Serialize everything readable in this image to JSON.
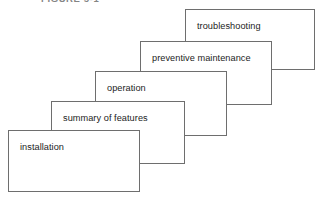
{
  "figure": {
    "caption": "FIGURE 5-1",
    "background_color": "#ffffff",
    "border_color": "#6e6e6e",
    "text_color": "#1c1c1c",
    "width": 322,
    "height": 201
  },
  "diagram": {
    "type": "cascade",
    "cards": [
      {
        "label": "troubleshooting",
        "order": 5,
        "x": 185,
        "y": 9,
        "width": 130,
        "height": 61,
        "z": 1
      },
      {
        "label": "preventive maintenance",
        "order": 4,
        "x": 140,
        "y": 41,
        "width": 132,
        "height": 64,
        "z": 2
      },
      {
        "label": "operation",
        "order": 3,
        "x": 95,
        "y": 71,
        "width": 132,
        "height": 65,
        "z": 3
      },
      {
        "label": "summary of features",
        "order": 2,
        "x": 51,
        "y": 101,
        "width": 134,
        "height": 63,
        "z": 4
      },
      {
        "label": "installation",
        "order": 1,
        "x": 8,
        "y": 130,
        "width": 132,
        "height": 62,
        "z": 5
      }
    ]
  }
}
